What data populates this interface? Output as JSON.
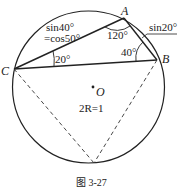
{
  "figure": {
    "caption": "图 3-27",
    "circle": {
      "center_label": "O",
      "diameter_label": "2R=1"
    },
    "points": {
      "A": {
        "label": "A"
      },
      "B": {
        "label": "B"
      },
      "C": {
        "label": "C"
      }
    },
    "angles": {
      "A": "120°",
      "B": "40°",
      "C": "20°"
    },
    "side_labels": {
      "CA_line1": "sin40°",
      "CA_line2": "=cos50°",
      "AB": "sin20°"
    },
    "colors": {
      "stroke": "#222222",
      "background": "#ffffff"
    }
  }
}
